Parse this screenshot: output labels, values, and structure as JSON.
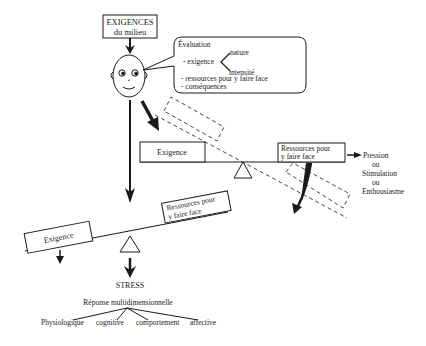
{
  "top_box": {
    "line1": "EXIGENCES",
    "line2": "du milieu"
  },
  "bubble": {
    "title": "Évaluation",
    "item_exigence": "- exigence",
    "branch_nature": "nature",
    "branch_intensite": "intensité",
    "item_ressources": "- ressources pour y faire face",
    "item_consequences": "- conséquences"
  },
  "upper_balance": {
    "left_label": "Exigence",
    "right_line1": "Ressources pour",
    "right_line2": "y faire face"
  },
  "outcome": {
    "line1": "Pression",
    "line2": "ou",
    "line3": "Stimulation",
    "line4": "ou",
    "line5": "Enthousiasme"
  },
  "lower_balance": {
    "left_label": "Exigence",
    "right_line1": "Ressources pour",
    "right_line2": "y faire face"
  },
  "stress": {
    "label": "STRESS",
    "response": "Réponse multidimensionnelle",
    "dimensions": [
      "Physiologique",
      "cognitive",
      "comportement",
      "affective"
    ]
  },
  "colors": {
    "ink": "#1a1a1a",
    "background": "#ffffff"
  }
}
